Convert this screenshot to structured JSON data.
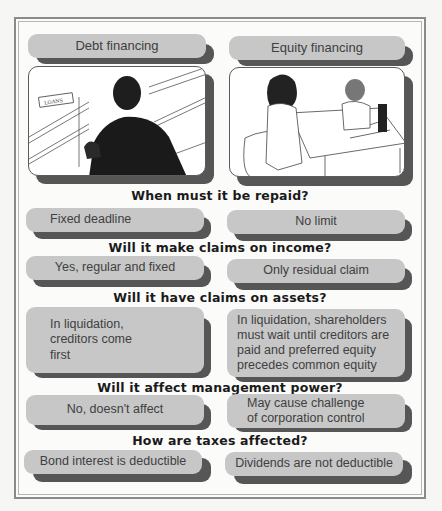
{
  "columns": {
    "debt": {
      "title": "Debt financing",
      "image": "person-at-loans-counter-illustration",
      "sign": "LOANS"
    },
    "equity": {
      "title": "Equity financing",
      "image": "two-women-meeting-at-desk-illustration"
    }
  },
  "rows": [
    {
      "question": "When must it be repaid?",
      "debt": "Fixed deadline",
      "equity": "No limit"
    },
    {
      "question": "Will it make claims on income?",
      "debt": "Yes, regular and fixed",
      "equity": "Only residual claim"
    },
    {
      "question": "Will it have claims on assets?",
      "debt": "In liquidation, creditors come first",
      "equity": "In liquidation, shareholders must wait until creditors are paid and preferred equity precedes common equity"
    },
    {
      "question": "Will it affect management power?",
      "debt": "No, doesn't affect",
      "equity": "May cause challenge of corporation control"
    },
    {
      "question": "How are taxes affected?",
      "debt": "Bond interest is deductible",
      "equity": "Dividends are not deductible"
    }
  ],
  "colors": {
    "pill": "#c7c7c7",
    "shadow": "#565656",
    "frame": "#8a8a8a",
    "text": "#404040"
  }
}
